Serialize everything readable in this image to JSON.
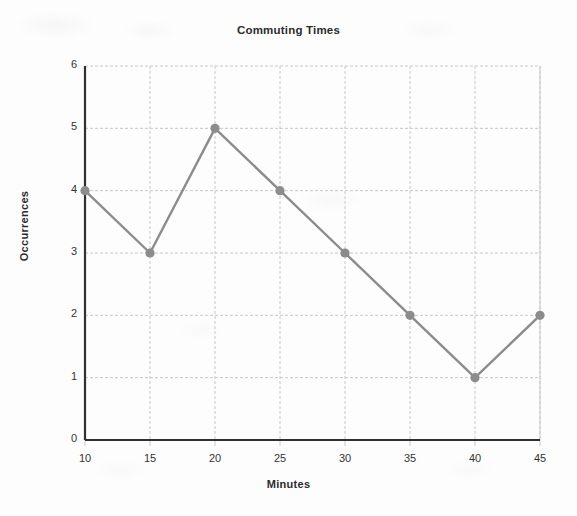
{
  "chart_data": {
    "type": "line",
    "title": "Commuting Times",
    "xlabel": "Minutes",
    "ylabel": "Occurrences",
    "x": [
      10,
      15,
      20,
      25,
      30,
      35,
      40,
      45
    ],
    "values": [
      4,
      3,
      5,
      4,
      3,
      2,
      1,
      2
    ],
    "xticks": [
      "10",
      "15",
      "20",
      "25",
      "30",
      "35",
      "40",
      "45"
    ],
    "yticks": [
      "0",
      "1",
      "2",
      "3",
      "4",
      "5",
      "6"
    ],
    "xlim": [
      10,
      45
    ],
    "ylim": [
      0,
      6
    ],
    "grid": true,
    "legend": false,
    "series_color": "#8c8c8c",
    "grid_color": "#c8c8c8",
    "axis_color": "#303030",
    "marker": "circle"
  }
}
